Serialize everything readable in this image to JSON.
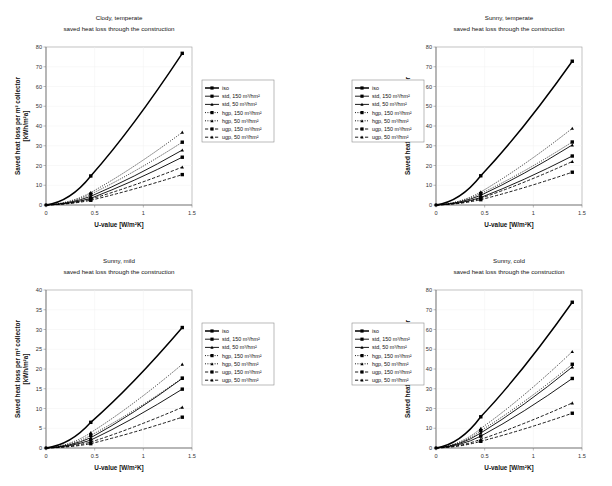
{
  "figure": {
    "common_subtitle": "saved heat loss through the construction",
    "xlabel": "U-value [W/m²K]",
    "ylabel_line1": "Saved heat loss per m² collector",
    "ylabel_line2": "[kWh/m²a]"
  },
  "legend": {
    "entries": [
      {
        "label": "iso",
        "style": "solid",
        "marker": "square",
        "width": 1.5
      },
      {
        "label": "std, 150 m³/hm²",
        "style": "solid",
        "marker": "square",
        "width": 0.9
      },
      {
        "label": "std, 50 m³/hm²",
        "style": "solid",
        "marker": "triangle",
        "width": 0.9
      },
      {
        "label": "hgp, 150 m³/hm²",
        "style": "dotted",
        "marker": "square",
        "width": 0.9
      },
      {
        "label": "hgp, 50 m³/hm²",
        "style": "dotted",
        "marker": "triangle",
        "width": 0.9
      },
      {
        "label": "ugp, 150 m³/hm²",
        "style": "dashed",
        "marker": "square",
        "width": 0.9
      },
      {
        "label": "ugp, 50 m³/hm²",
        "style": "dashed",
        "marker": "triangle",
        "width": 0.9
      }
    ]
  },
  "chart_data": [
    {
      "id": "clody-temperate",
      "type": "line",
      "title": "Clody, temperate",
      "subtitle": "saved heat loss through the construction",
      "xlabel": "U-value [W/m²K]",
      "ylabel": "Saved heat loss per m² collector [kWh/m²a]",
      "xlim": [
        0,
        1.5
      ],
      "ylim": [
        0,
        80
      ],
      "xticks": [
        0,
        0.5,
        1,
        1.5
      ],
      "yticks": [
        0,
        10,
        20,
        30,
        40,
        50,
        60,
        70,
        80
      ],
      "grid": true,
      "legend_position": "right",
      "x": [
        0,
        0.46,
        1.4
      ],
      "series": [
        {
          "name": "iso",
          "values": [
            0,
            14.7,
            76.8
          ]
        },
        {
          "name": "std, 150 m³/hm²",
          "values": [
            0,
            3.4,
            24.2
          ]
        },
        {
          "name": "std, 50 m³/hm²",
          "values": [
            0,
            4.4,
            27.8
          ]
        },
        {
          "name": "hgp, 150 m³/hm²",
          "values": [
            0,
            5.5,
            31.8
          ]
        },
        {
          "name": "hgp, 50 m³/hm²",
          "values": [
            0,
            6.3,
            36.8
          ]
        },
        {
          "name": "ugp, 150 m³/hm²",
          "values": [
            0,
            2.4,
            15.4
          ]
        },
        {
          "name": "ugp, 50 m³/hm²",
          "values": [
            0,
            3.0,
            19.2
          ]
        }
      ]
    },
    {
      "id": "sunny-temperate",
      "type": "line",
      "title": "Sunny, temperate",
      "subtitle": "saved heat loss through the construction",
      "xlabel": "U-value [W/m²K]",
      "ylabel": "Saved heat loss per m² collector [kWh/m²a]",
      "xlim": [
        0,
        1.5
      ],
      "ylim": [
        0,
        80
      ],
      "xticks": [
        0,
        0.5,
        1,
        1.5
      ],
      "yticks": [
        0,
        10,
        20,
        30,
        40,
        50,
        60,
        70,
        80
      ],
      "grid": true,
      "legend_position": "left",
      "x": [
        0,
        0.46,
        1.4
      ],
      "series": [
        {
          "name": "iso",
          "values": [
            0,
            14.8,
            72.8
          ]
        },
        {
          "name": "std, 150 m³/hm²",
          "values": [
            0,
            3.8,
            24.8
          ]
        },
        {
          "name": "std, 50 m³/hm²",
          "values": [
            0,
            4.9,
            30.4
          ]
        },
        {
          "name": "hgp, 150 m³/hm²",
          "values": [
            0,
            5.8,
            31.9
          ]
        },
        {
          "name": "hgp, 50 m³/hm²",
          "values": [
            0,
            6.6,
            38.8
          ]
        },
        {
          "name": "ugp, 150 m³/hm²",
          "values": [
            0,
            2.7,
            16.6
          ]
        },
        {
          "name": "ugp, 50 m³/hm²",
          "values": [
            0,
            3.4,
            22.0
          ]
        }
      ]
    },
    {
      "id": "sunny-mild",
      "type": "line",
      "title": "Sunny, mild",
      "subtitle": "saved heat loss through the construction",
      "xlabel": "U-value [W/m²K]",
      "ylabel": "Saved heat loss per m² collector [kWh/m²a]",
      "xlim": [
        0,
        1.5
      ],
      "ylim": [
        0,
        40
      ],
      "xticks": [
        0,
        0.5,
        1,
        1.5
      ],
      "yticks": [
        0,
        5,
        10,
        15,
        20,
        25,
        30,
        35,
        40
      ],
      "grid": true,
      "legend_position": "right",
      "x": [
        0,
        0.46,
        1.4
      ],
      "series": [
        {
          "name": "iso",
          "values": [
            0,
            6.5,
            30.5
          ]
        },
        {
          "name": "std, 150 m³/hm²",
          "values": [
            0,
            2.0,
            14.9
          ]
        },
        {
          "name": "std, 50 m³/hm²",
          "values": [
            0,
            2.6,
            17.6
          ]
        },
        {
          "name": "hgp, 150 m³/hm²",
          "values": [
            0,
            3.2,
            17.7
          ]
        },
        {
          "name": "hgp, 50 m³/hm²",
          "values": [
            0,
            3.9,
            21.2
          ]
        },
        {
          "name": "ugp, 150 m³/hm²",
          "values": [
            0,
            1.1,
            7.8
          ]
        },
        {
          "name": "ugp, 50 m³/hm²",
          "values": [
            0,
            1.5,
            10.3
          ]
        }
      ]
    },
    {
      "id": "sunny-cold",
      "type": "line",
      "title": "Sunny, cold",
      "subtitle": "saved heat loss through the construction",
      "xlabel": "U-value [W/m²K]",
      "ylabel": "Saved heat loss per m² collector [kWh/m²a]",
      "xlim": [
        0,
        1.5
      ],
      "ylim": [
        0,
        80
      ],
      "xticks": [
        0,
        0.5,
        1,
        1.5
      ],
      "yticks": [
        0,
        10,
        20,
        30,
        40,
        50,
        60,
        70,
        80
      ],
      "grid": true,
      "legend_position": "left",
      "x": [
        0,
        0.46,
        1.4
      ],
      "series": [
        {
          "name": "iso",
          "values": [
            0,
            15.8,
            73.8
          ]
        },
        {
          "name": "std, 150 m³/hm²",
          "values": [
            0,
            6.0,
            35.2
          ]
        },
        {
          "name": "std, 50 m³/hm²",
          "values": [
            0,
            7.6,
            41.0
          ]
        },
        {
          "name": "hgp, 150 m³/hm²",
          "values": [
            0,
            8.8,
            42.4
          ]
        },
        {
          "name": "hgp, 50 m³/hm²",
          "values": [
            0,
            9.9,
            48.8
          ]
        },
        {
          "name": "ugp, 150 m³/hm²",
          "values": [
            0,
            3.4,
            17.6
          ]
        },
        {
          "name": "ugp, 50 m³/hm²",
          "values": [
            0,
            4.4,
            22.8
          ]
        }
      ]
    }
  ]
}
